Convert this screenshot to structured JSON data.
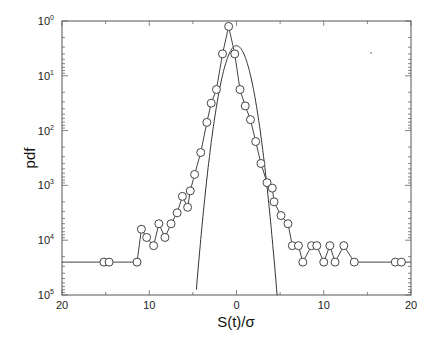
{
  "chart_data": {
    "type": "line",
    "title": "",
    "xlabel": "S(t)/σ",
    "ylabel": "pdf",
    "xlim": [
      -20,
      20
    ],
    "ylim_decades": [
      0,
      5
    ],
    "y_scale": "log",
    "grid": false,
    "legend": null,
    "x_tick_labels": [
      "20",
      "10",
      "0",
      "10",
      "20"
    ],
    "x_tick_values": [
      -20,
      -10,
      0,
      10,
      20
    ],
    "y_tick_labels": [
      {
        "base": "10",
        "exp": "0"
      },
      {
        "base": "10",
        "exp": "1"
      },
      {
        "base": "10",
        "exp": "2"
      },
      {
        "base": "10",
        "exp": "3"
      },
      {
        "base": "10",
        "exp": "4"
      },
      {
        "base": "10",
        "exp": "5"
      }
    ],
    "series": [
      {
        "name": "empirical pdf (circles)",
        "style": "line+open-circle",
        "x_start_line": -20,
        "x": [
          -15.2,
          -14.6,
          -11.4,
          -10.9,
          -10.3,
          -9.5,
          -8.9,
          -8.2,
          -7.5,
          -6.8,
          -6.2,
          -5.6,
          -5.3,
          -4.8,
          -4.1,
          -3.4,
          -2.9,
          -2.3,
          -1.6,
          -0.9,
          -0.2,
          0.4,
          1.0,
          1.6,
          2.2,
          2.8,
          3.5,
          4.1,
          4.3,
          5.1,
          5.9,
          6.4,
          7.1,
          7.6,
          8.6,
          9.2,
          10.0,
          10.7,
          11.3,
          12.3,
          13.5,
          18.2,
          18.9
        ],
        "y_decade": [
          4.4,
          4.4,
          4.4,
          3.8,
          3.95,
          4.1,
          3.7,
          3.95,
          3.7,
          3.5,
          3.2,
          3.4,
          3.1,
          2.8,
          2.4,
          1.85,
          1.5,
          1.25,
          0.6,
          0.1,
          0.6,
          1.25,
          1.55,
          1.8,
          2.2,
          2.6,
          2.95,
          3.05,
          3.3,
          3.55,
          3.7,
          4.1,
          4.1,
          4.4,
          4.1,
          4.1,
          4.4,
          4.1,
          4.4,
          4.1,
          4.4,
          4.4
        ],
        "x_end_line": 20,
        "y_end_line_decade": 4.4
      },
      {
        "name": "gaussian fit",
        "style": "solid-line",
        "peak_x": 0,
        "peak_y_decade": 0.45,
        "zero_crossing_bottom_x": [
          -4.6,
          4.7
        ]
      }
    ],
    "annotations": []
  }
}
